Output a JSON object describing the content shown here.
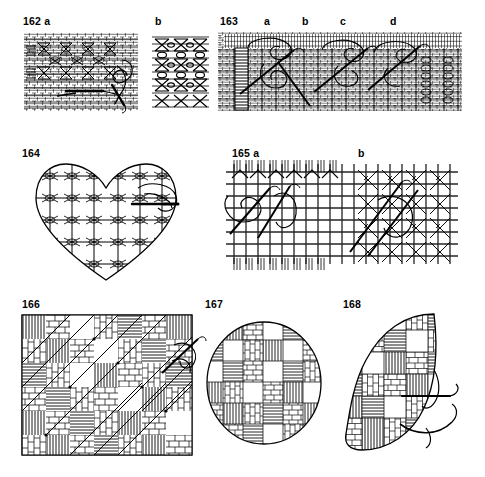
{
  "plate": {
    "title": "Needlework stitch plate 162-168",
    "background_color": "#ffffff",
    "ink_color": "#000000",
    "width": 485,
    "height": 477
  },
  "labels": [
    {
      "id": "lbl-162",
      "text": "162 a",
      "x": 23,
      "y": 16
    },
    {
      "id": "lbl-162b",
      "text": "b",
      "x": 155,
      "y": 16
    },
    {
      "id": "lbl-163",
      "text": "163",
      "x": 220,
      "y": 16
    },
    {
      "id": "lbl-163a",
      "text": "a",
      "x": 264,
      "y": 16
    },
    {
      "id": "lbl-163b",
      "text": "b",
      "x": 302,
      "y": 16
    },
    {
      "id": "lbl-163c",
      "text": "c",
      "x": 340,
      "y": 16
    },
    {
      "id": "lbl-163d",
      "text": "d",
      "x": 390,
      "y": 16
    },
    {
      "id": "lbl-164",
      "text": "164",
      "x": 22,
      "y": 148
    },
    {
      "id": "lbl-165",
      "text": "165 a",
      "x": 232,
      "y": 148
    },
    {
      "id": "lbl-165b",
      "text": "b",
      "x": 358,
      "y": 148
    },
    {
      "id": "lbl-166",
      "text": "166",
      "x": 22,
      "y": 299
    },
    {
      "id": "lbl-167",
      "text": "167",
      "x": 205,
      "y": 299
    },
    {
      "id": "lbl-168",
      "text": "168",
      "x": 343,
      "y": 299
    }
  ],
  "figures": [
    {
      "id": "fig-162a",
      "number": "162 a",
      "shape": "rectangle",
      "subject": "woven lattice band with hourglass motifs, needle and working thread",
      "has_needle": true,
      "x": 24,
      "y": 33,
      "width": 114,
      "height": 78
    },
    {
      "id": "fig-162b",
      "number": "162 b",
      "shape": "rectangle",
      "subject": "dense lattice of stacked hourglass motifs",
      "has_needle": false,
      "x": 152,
      "y": 33,
      "width": 57,
      "height": 78
    },
    {
      "id": "fig-163",
      "number": "163",
      "shape": "long-band",
      "subject": "wide woven band, four worked stages a b c d, three needles with loops",
      "has_needle": true,
      "x": 218,
      "y": 32,
      "width": 244,
      "height": 79
    },
    {
      "id": "fig-164",
      "number": "164",
      "shape": "heart",
      "subject": "heart filled with woven lattice darning, needle at right with thread",
      "has_needle": true,
      "x": 32,
      "y": 158,
      "width": 148,
      "height": 125
    },
    {
      "id": "fig-165",
      "number": "165",
      "shape": "rectangle",
      "subject": "open canvas grid, stage a loose weave, stage b worked cross stitches",
      "has_needle": true,
      "x": 226,
      "y": 160,
      "width": 232,
      "height": 110
    },
    {
      "id": "fig-166",
      "number": "166",
      "shape": "rectangle",
      "subject": "rectangular sampler of woven checkerboard blocks with diagonal stitches and needle",
      "has_needle": true,
      "x": 22,
      "y": 315,
      "width": 170,
      "height": 140
    },
    {
      "id": "fig-167",
      "number": "167",
      "shape": "circle",
      "subject": "circular motif of woven checkerboard blocks",
      "has_needle": false,
      "x": 205,
      "y": 320,
      "width": 118,
      "height": 126
    },
    {
      "id": "fig-168",
      "number": "168",
      "shape": "leaf",
      "subject": "leaf shape filled with woven blocks, needle and thread at lower right",
      "has_needle": true,
      "x": 340,
      "y": 308,
      "width": 130,
      "height": 155
    }
  ]
}
